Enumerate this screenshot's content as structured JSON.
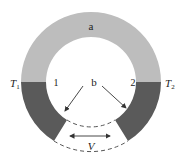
{
  "diagram": {
    "type": "thermocouple-ring",
    "labels": {
      "top_segment": "a",
      "lower_segment": "b",
      "junction_left": "1",
      "junction_right": "2",
      "temp_left": "T",
      "temp_left_sub": "1",
      "temp_right": "T",
      "temp_right_sub": "2",
      "voltage": "V"
    },
    "colors": {
      "segment_a": "#bdbdbd",
      "segment_b": "#5a5a5a",
      "dashed": "#555555",
      "arrow": "#333333"
    }
  }
}
